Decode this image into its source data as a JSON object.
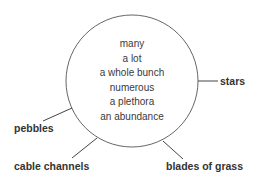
{
  "diagram": {
    "center_words": [
      "many",
      "a lot",
      "a whole bunch",
      "numerous",
      "a plethora",
      "an abundance"
    ],
    "labels": {
      "stars": "stars",
      "pebbles": "pebbles",
      "cable_channels": "cable channels",
      "blades_of_grass": "blades of grass"
    },
    "colors": {
      "stroke": "#666666",
      "text": "#333333"
    }
  }
}
